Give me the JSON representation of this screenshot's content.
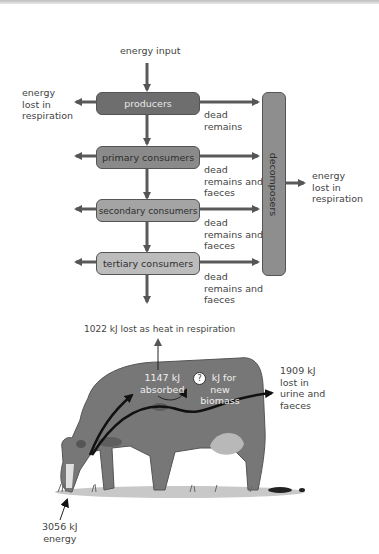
{
  "food_chain": {
    "energy_input": "energy input",
    "left_loss": [
      "energy",
      "lost in",
      "respiration"
    ],
    "levels": [
      {
        "label": "producers",
        "fill": "#6e6e6e",
        "text_color": "#e8e8e8",
        "side": [
          "dead",
          "remains"
        ]
      },
      {
        "label": "primary consumers",
        "fill": "#8a8a8a",
        "text_color": "#2e2e2e",
        "side": [
          "dead",
          "remains and",
          "faeces"
        ]
      },
      {
        "label": "secondary consumers",
        "fill": "#a4a4a4",
        "text_color": "#2e2e2e",
        "side": [
          "dead",
          "remains and",
          "faeces"
        ]
      },
      {
        "label": "tertiary consumers",
        "fill": "#bcbcbc",
        "text_color": "#2e2e2e",
        "side": [
          "dead",
          "remains and",
          "faeces"
        ]
      }
    ],
    "decomposers": {
      "label": "decomposers",
      "fill": "#8e8e8e"
    },
    "right_loss": [
      "energy",
      "lost in",
      "respiration"
    ]
  },
  "cow": {
    "respiration_loss": "1022 kJ lost as heat in respiration",
    "absorbed": [
      "1147 kJ",
      "absorbed"
    ],
    "biomass_marker": "?",
    "biomass": [
      "kJ for",
      "new",
      "biomass"
    ],
    "waste": [
      "1909 kJ",
      "lost in",
      "urine and",
      "faeces"
    ],
    "intake": [
      "3056 kJ",
      "energy"
    ]
  }
}
